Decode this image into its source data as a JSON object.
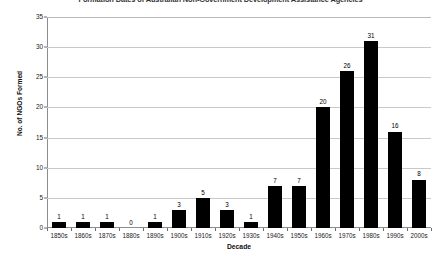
{
  "chart_data": {
    "type": "bar",
    "title": "Formation Dates of Australian Non-Government Development Assistance Agencies",
    "xlabel": "Decade",
    "ylabel": "No. of NGOs Formed",
    "categories": [
      "1850s",
      "1860s",
      "1870s",
      "1880s",
      "1890s",
      "1900s",
      "1910s",
      "1920s",
      "1930s",
      "1940s",
      "1950s",
      "1960s",
      "1970s",
      "1980s",
      "1990s",
      "2000s"
    ],
    "values": [
      1,
      1,
      1,
      0,
      1,
      3,
      5,
      3,
      1,
      7,
      7,
      20,
      26,
      31,
      16,
      8
    ],
    "data_labels": [
      "1",
      "1",
      "1",
      "0",
      "1",
      "3",
      "5",
      "3",
      "1",
      "7",
      "7",
      "20",
      "26",
      "31",
      "16",
      "8"
    ],
    "ylim": [
      0,
      35
    ],
    "ytick_values": [
      0,
      5,
      10,
      15,
      20,
      25,
      30,
      35
    ],
    "ytick_labels": [
      "0",
      "5",
      "10",
      "15",
      "20",
      "25",
      "30",
      "35"
    ],
    "grid": "horizontal",
    "legend": "none",
    "bar_color": "#000000",
    "gridline_color": "#c9c9c9",
    "axis_color": "#8d8d8d",
    "background_color": "#ffffff"
  }
}
